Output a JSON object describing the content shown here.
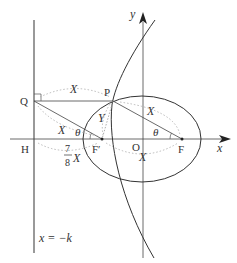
{
  "diagram": {
    "axes": {
      "x_label": "x",
      "y_label": "y",
      "origin_label": "O"
    },
    "points": {
      "Q": "Q",
      "P": "P",
      "H": "H",
      "F": "F",
      "F_prime": "F′"
    },
    "segment_labels": {
      "QP": "X",
      "PF": "X",
      "QF_prime": "X",
      "PF_prime": "Y",
      "F_prime_F": "X",
      "HF_prime_num": "7",
      "HF_prime_den": "8",
      "HF_prime_var": "X"
    },
    "angles": {
      "at_F_prime": "θ",
      "at_F": "θ"
    },
    "directrix_label": "x = −k",
    "colors": {
      "stroke": "#333333",
      "dotted": "#aaaaaa"
    }
  }
}
